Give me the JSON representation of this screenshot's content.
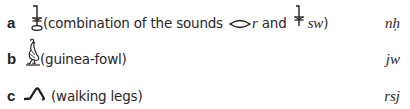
{
  "items": [
    {
      "letter": "a",
      "glyph": "nh-combination-sign-icon",
      "description_prefix": "(combination of the sounds",
      "sound_1_glyph": "mouth-sign-icon",
      "sound_1": "r",
      "conjunction": "and",
      "sound_2_glyph": "sw-plant-sign-icon",
      "sound_2": "sw",
      "description_suffix": ")",
      "transliteration": "nḥ"
    },
    {
      "letter": "b",
      "glyph": "guinea-fowl-sign-icon",
      "description": "(guinea-fowl)",
      "transliteration": "jw"
    },
    {
      "letter": "c",
      "glyph": "walking-legs-sign-icon",
      "description": "(walking legs)",
      "transliteration": "rsj"
    }
  ],
  "colors": {
    "text": "#231f20",
    "background": "#ffffff"
  }
}
